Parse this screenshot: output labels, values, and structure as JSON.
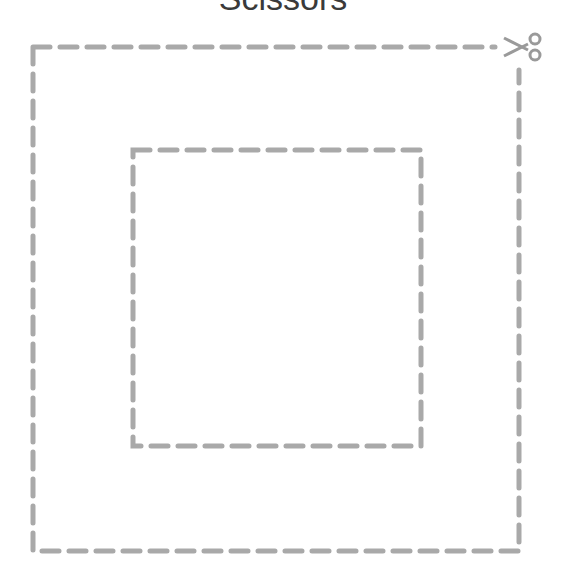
{
  "title": "Scissors",
  "colors": {
    "dash": "#a9a9a9",
    "title": "#3a3a3a",
    "background": "#ffffff"
  },
  "outer_square": {
    "x1": 33,
    "y1": 47,
    "x2": 519,
    "y2": 551
  },
  "inner_square": {
    "x1": 133,
    "y1": 150,
    "x2": 421,
    "y2": 446
  },
  "icon": "scissors-icon"
}
